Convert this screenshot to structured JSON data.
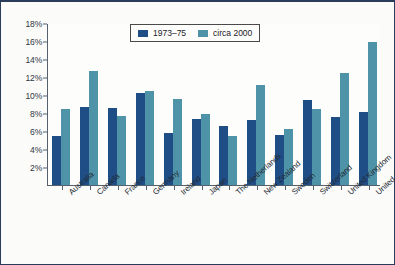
{
  "chart_data": {
    "type": "bar",
    "title": "",
    "xlabel": "",
    "ylabel": "",
    "ylim": [
      0,
      18
    ],
    "ytick_step": 2,
    "ytick_labels": [
      "18%",
      "16%",
      "14%",
      "12%",
      "10%",
      "8%",
      "6%",
      "4%",
      "2%"
    ],
    "ytick_values": [
      18,
      16,
      14,
      12,
      10,
      8,
      6,
      4,
      2
    ],
    "grid": false,
    "legend_position": "top-center",
    "categories": [
      "Australia",
      "Canada",
      "France",
      "Germany",
      "Ireland",
      "Japan",
      "The Netherlands",
      "New Zealand",
      "Sweden",
      "Switzerland",
      "United Kingdom",
      "United States"
    ],
    "series": [
      {
        "name": "1973–75",
        "color": "#1f4e87",
        "values": [
          5.5,
          8.7,
          8.6,
          10.2,
          5.8,
          7.3,
          6.6,
          7.2,
          5.6,
          9.5,
          7.6,
          8.1
        ]
      },
      {
        "name": "circa 2000",
        "color": "#4e93a8",
        "values": [
          8.4,
          12.7,
          7.7,
          10.4,
          9.6,
          7.9,
          5.4,
          11.1,
          6.2,
          8.5,
          12.4,
          15.9
        ]
      }
    ]
  },
  "legend": {
    "items": [
      {
        "label": "1973–75",
        "swatch": "series-0-swatch"
      },
      {
        "label": "circa 2000",
        "swatch": "series-1-swatch"
      }
    ]
  },
  "colors": {
    "series_0": "#1f4e87",
    "series_1": "#4e93a8",
    "axis": "#55616f",
    "frame": "#2b3c5a",
    "background": "#fbfbfa",
    "text": "#222a33"
  }
}
